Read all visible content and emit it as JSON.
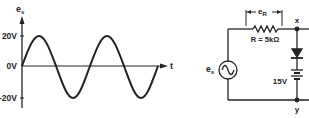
{
  "waveform": {
    "y_axis_label": "e",
    "y_axis_label_sub": "s",
    "x_axis_label": "t",
    "ticks": [
      {
        "label": "20V",
        "value": 20
      },
      {
        "label": "0V",
        "value": 0
      },
      {
        "label": "-20V",
        "value": -20
      }
    ],
    "amplitude_v": 20,
    "cycles": 2,
    "color": "#222222"
  },
  "circuit": {
    "source_label": "e",
    "source_label_sub": "s",
    "resistor_label": "R = 5kΩ",
    "resistor_voltage_label": "e",
    "resistor_voltage_label_sub": "R",
    "battery_label": "15V",
    "node_top_label": "x",
    "node_bottom_label": "y"
  }
}
